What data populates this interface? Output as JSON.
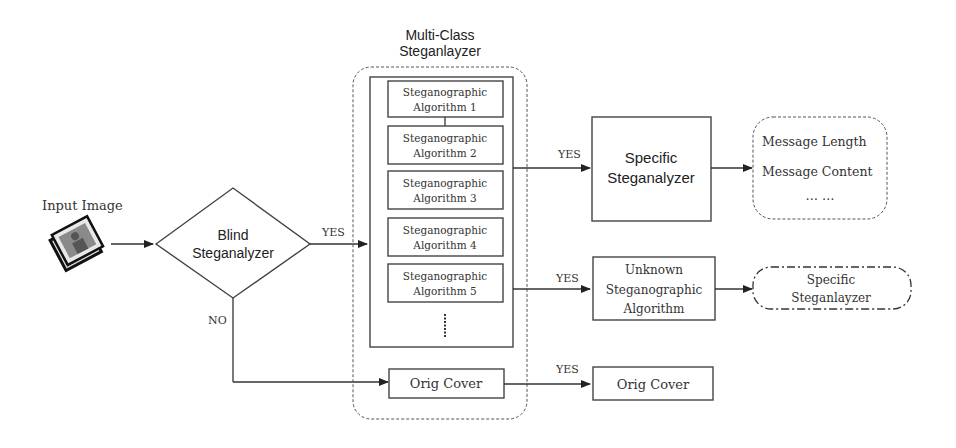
{
  "diagram": {
    "input": {
      "label": "Input Image",
      "icon": "photo-stack-icon"
    },
    "blind": {
      "line1": "Blind",
      "line2": "Steganalyzer"
    },
    "multiclass": {
      "title_line1": "Multi-Class",
      "title_line2": "Steganlayzer",
      "algorithms": [
        {
          "line1": "Steganographic",
          "line2": "Algorithm 1"
        },
        {
          "line1": "Steganographic",
          "line2": "Algorithm 2"
        },
        {
          "line1": "Steganographic",
          "line2": "Algorithm 3"
        },
        {
          "line1": "Steganographic",
          "line2": "Algorithm 4"
        },
        {
          "line1": "Steganographic",
          "line2": "Algorithm 5"
        }
      ],
      "ellipsis": "⋮",
      "orig_cover": "Orig Cover"
    },
    "specific": {
      "line1": "Specific",
      "line2": "Steganalyzer"
    },
    "output": {
      "line1": "Message Length",
      "line2": "Message Content",
      "line3": "… …"
    },
    "unknown": {
      "line1": "Unknown",
      "line2": "Steganographic",
      "line3": "Algorithm"
    },
    "specific2": {
      "line1": "Specific",
      "line2": "Steganlayzer"
    },
    "orig_cover_out": "Orig Cover",
    "labels": {
      "yes1": "YES",
      "yes2": "YES",
      "yes3": "YES",
      "yes4": "YES",
      "no": "NO"
    }
  }
}
